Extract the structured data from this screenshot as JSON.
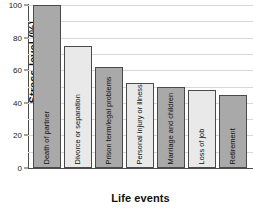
{
  "chart_data": {
    "type": "bar",
    "title": "",
    "xlabel": "Life events",
    "ylabel": "Stress level (%)",
    "categories": [
      "Death of partner",
      "Divorce or separation",
      "Prison term/legal problems",
      "Personal injury or illness",
      "Marriage and children",
      "Loss of job",
      "Retirement"
    ],
    "values": [
      100,
      75,
      62,
      52,
      50,
      48,
      45
    ],
    "ylim": [
      0,
      100
    ],
    "yticks": [
      0,
      20,
      40,
      60,
      80,
      100
    ],
    "ytick_labels": [
      "0",
      "20",
      "40",
      "60",
      "80",
      "100"
    ],
    "grid": "horizontal-minor-every-10",
    "gridlines": [
      10,
      20,
      30,
      40,
      50,
      60,
      70,
      80,
      90,
      100
    ],
    "legend": "none",
    "bar_colors": [
      "#a9a9a9",
      "#e9e9e9",
      "#a9a9a9",
      "#e9e9e9",
      "#a9a9a9",
      "#e9e9e9",
      "#a9a9a9"
    ],
    "bar_edge_color": "#4a4a4a",
    "axis_color": "#4d4d4d",
    "grid_color": "#d7d7d7",
    "background": "#ffffff"
  }
}
